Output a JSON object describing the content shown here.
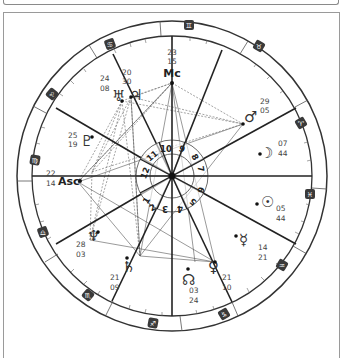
{
  "chart": {
    "angles": {
      "mc": {
        "label": "Mc",
        "deg": "23",
        "min": "15"
      },
      "asc": {
        "label": "Asc",
        "deg": "22",
        "min": "14"
      }
    },
    "planets": [
      {
        "name": "jupiter",
        "glyph": "♃",
        "deg": "20",
        "min": "30"
      },
      {
        "name": "uranus",
        "glyph": "♅",
        "deg": "24",
        "min": "08"
      },
      {
        "name": "pluto",
        "glyph": "♇",
        "deg": "25",
        "min": "19"
      },
      {
        "name": "mars",
        "glyph": "♂",
        "deg": "29",
        "min": "05"
      },
      {
        "name": "moon",
        "glyph": "☽",
        "deg": "07",
        "min": "44"
      },
      {
        "name": "sun",
        "glyph": "☉",
        "deg": "05",
        "min": "44"
      },
      {
        "name": "mercury",
        "glyph": "☿",
        "deg": "14",
        "min": "21"
      },
      {
        "name": "venus",
        "glyph": "♀",
        "deg": "21",
        "min": "10"
      },
      {
        "name": "node",
        "glyph": "☊",
        "deg": "03",
        "min": "24"
      },
      {
        "name": "saturn",
        "glyph": "♄",
        "deg": "21",
        "min": "09"
      },
      {
        "name": "neptune",
        "glyph": "♆",
        "deg": "28",
        "min": "03"
      }
    ],
    "houses": [
      "1",
      "2",
      "3",
      "4",
      "5",
      "6",
      "7",
      "8",
      "9",
      "10",
      "11",
      "12"
    ],
    "zodiac": [
      {
        "sign": "gemini",
        "glyph": "♊"
      },
      {
        "sign": "taurus",
        "glyph": "♉"
      },
      {
        "sign": "aries",
        "glyph": "♈"
      },
      {
        "sign": "pisces",
        "glyph": "♓"
      },
      {
        "sign": "aquarius",
        "glyph": "♒"
      },
      {
        "sign": "capricorn",
        "glyph": "♑"
      },
      {
        "sign": "sagittarius",
        "glyph": "♐"
      },
      {
        "sign": "scorpio",
        "glyph": "♏"
      },
      {
        "sign": "libra",
        "glyph": "♎"
      },
      {
        "sign": "virgo",
        "glyph": "♍"
      },
      {
        "sign": "leo",
        "glyph": "♌"
      },
      {
        "sign": "cancer",
        "glyph": "♋"
      }
    ],
    "colors": {
      "line": "#222222",
      "ring": "#333333",
      "badge": "#3a3a3a"
    }
  }
}
